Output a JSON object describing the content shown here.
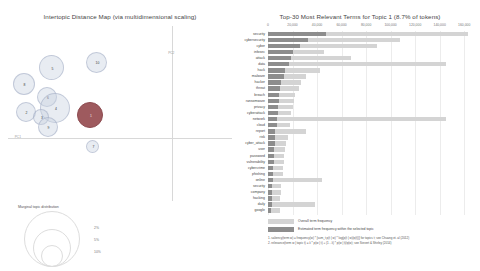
{
  "left_panel": {
    "title": "Intertopic Distance Map (via multidimensional scaling)",
    "axis_labels": {
      "x": "PC1",
      "y": "PC2"
    },
    "topics": [
      {
        "id": "5",
        "label": "5",
        "cx": 43.5,
        "cy": 41.5,
        "r": 12.5,
        "selected": false
      },
      {
        "id": "8",
        "label": "8",
        "cx": 15.5,
        "cy": 58.0,
        "r": 11.0,
        "selected": false
      },
      {
        "id": "2",
        "label": "2",
        "cx": 17.5,
        "cy": 85.5,
        "r": 10.0,
        "selected": false
      },
      {
        "id": "6",
        "label": "6",
        "cx": 39.0,
        "cy": 70.5,
        "r": 10.0,
        "selected": false
      },
      {
        "id": "4",
        "label": "4",
        "cx": 47.0,
        "cy": 82.0,
        "r": 15.0,
        "selected": false
      },
      {
        "id": "3",
        "label": "3",
        "cx": 33.0,
        "cy": 90.5,
        "r": 8.0,
        "selected": false
      },
      {
        "id": "9",
        "label": "9",
        "cx": 39.5,
        "cy": 101.0,
        "r": 10.0,
        "selected": false
      },
      {
        "id": "10",
        "label": "10",
        "cx": 88.5,
        "cy": 36.0,
        "r": 10.5,
        "selected": false
      },
      {
        "id": "7",
        "label": "7",
        "cx": 84.5,
        "cy": 120.0,
        "r": 6.5,
        "selected": false
      },
      {
        "id": "1",
        "label": "1",
        "cx": 82.0,
        "cy": 88.5,
        "r": 13.0,
        "selected": true
      }
    ],
    "size_legend": {
      "title": "Marginal topic distribution",
      "values": [
        "2%",
        "5%",
        "10%"
      ]
    }
  },
  "right_panel": {
    "title": "Top-30 Most Relevant Terms for Topic 1 (8.7% of tokens)",
    "legend": [
      {
        "key": "overall",
        "label": "Overall term frequency"
      },
      {
        "key": "estimated",
        "label": "Estimated term frequency within the selected topic"
      }
    ],
    "footnotes": [
      "1. saliency(term w) = frequency(w) * [sum_t p(t | w) * log(p(t | w)/p(t))] for topics t; see Chuang et. al (2012)",
      "2. relevance(term w | topic t) = λ * p(w | t) + (1 - λ) * p(w | t)/p(w); see Sievert & Shirley (2014)"
    ]
  },
  "chart_data": {
    "type": "bar",
    "title": "Top-30 Most Relevant Terms for Topic 1 (8.7% of tokens)",
    "xlabel": "",
    "ylabel": "",
    "xlim": [
      0,
      168000
    ],
    "grid": true,
    "orientation": "horizontal",
    "legend_position": "bottom",
    "xticks": [
      0,
      20000,
      40000,
      60000,
      80000,
      100000,
      120000,
      140000,
      160000
    ],
    "xtick_labels": [
      "0",
      "20,000",
      "40,000",
      "60,000",
      "80,000",
      "100,000",
      "120,000",
      "140,000",
      "160,000"
    ],
    "categories": [
      "security",
      "cybersecurity",
      "cyber",
      "infosec",
      "attack",
      "data",
      "hack",
      "malware",
      "hacker",
      "threat",
      "breach",
      "ransomware",
      "privacy",
      "cyberattack",
      "network",
      "cloud",
      "report",
      "risk",
      "cyber_attack",
      "user",
      "password",
      "vulnerability",
      "cybercrime",
      "phishing",
      "online",
      "security",
      "company",
      "hacking",
      "daily",
      "google"
    ],
    "series": [
      {
        "name": "Overall term frequency",
        "values": [
          163000,
          108000,
          89000,
          46000,
          68000,
          145000,
          42000,
          31000,
          27000,
          25000,
          22000,
          21000,
          20000,
          19000,
          145000,
          18000,
          31000,
          16000,
          15000,
          14000,
          13000,
          13000,
          12000,
          12000,
          44000,
          11000,
          11000,
          10000,
          38000,
          10000
        ]
      },
      {
        "name": "Estimated term frequency within the selected topic",
        "values": [
          47000,
          33000,
          26000,
          20000,
          19000,
          17000,
          14000,
          13000,
          11000,
          10000,
          9000,
          9000,
          8000,
          8000,
          7000,
          7000,
          6000,
          6000,
          5500,
          5000,
          4800,
          4500,
          4200,
          4000,
          3800,
          3600,
          3400,
          3200,
          3000,
          2800
        ]
      }
    ]
  }
}
